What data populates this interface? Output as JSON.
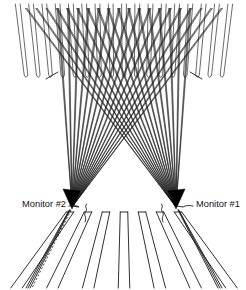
{
  "figure": {
    "background_color": "#ffffff",
    "line_color": "#1a1a1a",
    "fill_color": "#000000",
    "width": 246,
    "height": 290
  },
  "labels": {
    "left": {
      "text": "Monitor #2",
      "x": 66,
      "y": 205,
      "anchor": "end"
    },
    "right": {
      "text": "Monitor #1",
      "x": 196,
      "y": 205,
      "anchor": "start"
    }
  },
  "chart_data": {
    "type": "line",
    "xlabel": "",
    "ylabel": "",
    "grid": false,
    "legend_position": "none",
    "xlim": [
      0,
      246
    ],
    "ylim": [
      0,
      290
    ],
    "annotations": [
      "Monitor #2",
      "Monitor #1"
    ],
    "apex_points": [
      {
        "name": "Monitor #2",
        "x": 72,
        "y": 207
      },
      {
        "name": "Monitor #1",
        "x": 176,
        "y": 207
      }
    ],
    "ray_count_per_fan": 17,
    "top_slot_count": 17,
    "bottom_wedge_count": 7,
    "series": [
      {
        "name": "fan-left",
        "origin": [
          72,
          207
        ],
        "target_span_x": [
          58,
          222
        ],
        "target_y": 8
      },
      {
        "name": "fan-right",
        "origin": [
          176,
          207
        ],
        "target_span_x": [
          26,
          190
        ],
        "target_y": 8
      }
    ],
    "top_slot_span_x": [
      26,
      222
    ],
    "top_slot_y_range": [
      8,
      78
    ],
    "bottom_wedge_y_range": [
      212,
      288
    ],
    "tick_marks": [
      {
        "x": 58,
        "y": 74
      },
      {
        "x": 190,
        "y": 74
      }
    ]
  },
  "elements": {
    "left_fan_name": "ray-fan-from-monitor-2",
    "right_fan_name": "ray-fan-from-monitor-1",
    "top_slots_name": "top-aperture-slot-array",
    "bottom_wedges_name": "bottom-radiating-wedge-array",
    "left_marker_name": "monitor-2-marker-wedge",
    "right_marker_name": "monitor-1-marker-wedge"
  }
}
